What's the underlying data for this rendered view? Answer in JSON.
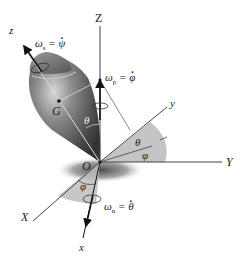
{
  "figure": {
    "type": "Euler angles diagram of a spinning top",
    "axes_fixed": {
      "X": "X",
      "Y": "Y",
      "Z": "Z"
    },
    "axes_body": {
      "x": "x",
      "y": "y",
      "z": "z"
    },
    "points": {
      "origin": "O",
      "center_of_mass": "G"
    },
    "angles": {
      "theta_top": "θ",
      "theta_plane": "θ",
      "phi_plane": "φ",
      "phi_bottom": "φ"
    },
    "angular_velocities": {
      "spin": {
        "symbol": "ω",
        "sub": "s",
        "rhs": "ψ"
      },
      "precession": {
        "symbol": "ω",
        "sub": "p",
        "rhs": "φ"
      },
      "nutation": {
        "symbol": "ω",
        "sub": "n",
        "rhs": "θ"
      }
    },
    "colors": {
      "line": "#333333",
      "shade": "#b8b8b8",
      "top_body": "#6e6e6e",
      "shadow": "#555555"
    }
  }
}
